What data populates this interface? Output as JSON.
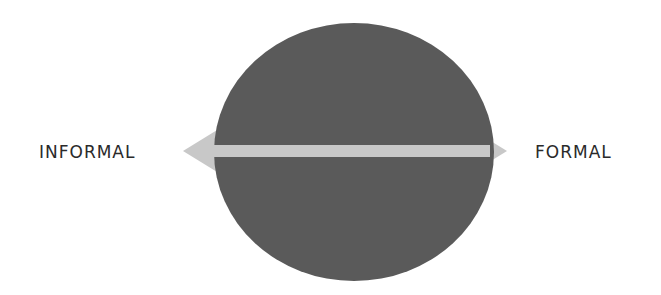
{
  "diagram": {
    "left_label": "INFORMAL",
    "right_label": "FORMAL",
    "colors": {
      "circle": "#5a5a5a",
      "arrow": "#c8c8c8",
      "text": "#2a2a2a",
      "background": "#ffffff"
    }
  }
}
